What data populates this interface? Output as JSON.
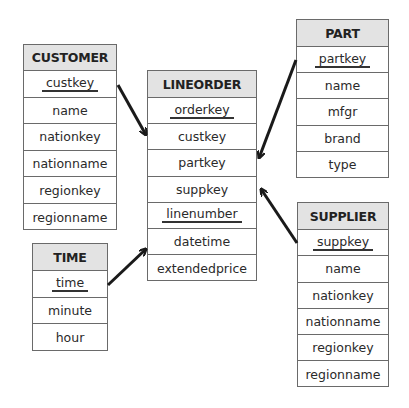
{
  "diagram": {
    "type": "star-schema",
    "entities": {
      "customer": {
        "title": "CUSTOMER",
        "attributes": [
          {
            "name": "custkey",
            "key": true
          },
          {
            "name": "name",
            "key": false
          },
          {
            "name": "nationkey",
            "key": false
          },
          {
            "name": "nationname",
            "key": false
          },
          {
            "name": "regionkey",
            "key": false
          },
          {
            "name": "regionname",
            "key": false
          }
        ]
      },
      "lineorder": {
        "title": "LINEORDER",
        "attributes": [
          {
            "name": "orderkey",
            "key": true
          },
          {
            "name": "custkey",
            "key": false
          },
          {
            "name": "partkey",
            "key": false
          },
          {
            "name": "suppkey",
            "key": false
          },
          {
            "name": "linenumber",
            "key": true
          },
          {
            "name": "datetime",
            "key": false
          },
          {
            "name": "extendedprice",
            "key": false
          }
        ]
      },
      "part": {
        "title": "PART",
        "attributes": [
          {
            "name": "partkey",
            "key": true
          },
          {
            "name": "name",
            "key": false
          },
          {
            "name": "mfgr",
            "key": false
          },
          {
            "name": "brand",
            "key": false
          },
          {
            "name": "type",
            "key": false
          }
        ]
      },
      "supplier": {
        "title": "SUPPLIER",
        "attributes": [
          {
            "name": "suppkey",
            "key": true
          },
          {
            "name": "name",
            "key": false
          },
          {
            "name": "nationkey",
            "key": false
          },
          {
            "name": "nationname",
            "key": false
          },
          {
            "name": "regionkey",
            "key": false
          },
          {
            "name": "regionname",
            "key": false
          }
        ]
      },
      "time": {
        "title": "TIME",
        "attributes": [
          {
            "name": "time",
            "key": true
          },
          {
            "name": "minute",
            "key": false
          },
          {
            "name": "hour",
            "key": false
          }
        ]
      }
    },
    "relationships": [
      {
        "from": "CUSTOMER.custkey",
        "to": "LINEORDER.custkey"
      },
      {
        "from": "PART.partkey",
        "to": "LINEORDER.partkey"
      },
      {
        "from": "SUPPLIER.suppkey",
        "to": "LINEORDER.suppkey"
      },
      {
        "from": "TIME.time",
        "to": "LINEORDER.datetime"
      }
    ],
    "colors": {
      "header_bg": "#e3e3e3",
      "border": "#6a6a6a",
      "arrow": "#1a1a1a"
    }
  }
}
